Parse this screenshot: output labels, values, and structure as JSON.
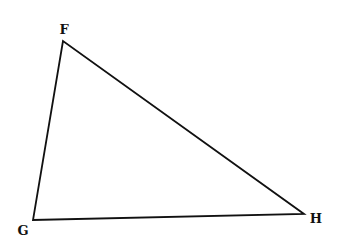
{
  "diagram": {
    "type": "triangle",
    "vertices": [
      {
        "label": "F",
        "x": 63,
        "y": 41,
        "label_x": 64,
        "label_y": 34
      },
      {
        "label": "G",
        "x": 33,
        "y": 220,
        "label_x": 23,
        "label_y": 235
      },
      {
        "label": "H",
        "x": 304,
        "y": 214,
        "label_x": 316,
        "label_y": 223
      }
    ],
    "stroke_color": "#111111",
    "background_color": "#ffffff"
  }
}
